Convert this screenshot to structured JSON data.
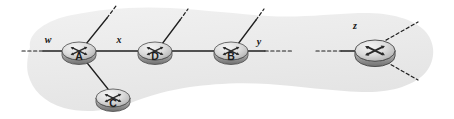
{
  "diagram": {
    "type": "network-diagram",
    "canvas": {
      "width": 454,
      "height": 119
    },
    "colors": {
      "background": "#ffffff",
      "cloud_fill": "#ececec",
      "cloud_fill_light": "#f3f3f3",
      "link_stroke": "#1f1f1f",
      "router_body_light": "#e8e8e8",
      "router_body_mid": "#b9b9b9",
      "router_body_dark": "#8d8d8d",
      "router_outline": "#4a4a4a",
      "label_text": "#141414"
    },
    "cloud": {
      "name": "network-cloud",
      "description": "irregular light gray amoeba-shaped region enclosing the routers"
    },
    "routers": [
      {
        "id": "A",
        "label": "A",
        "cx": 79,
        "cy": 51,
        "rx": 17,
        "ry": 9,
        "has_label": true
      },
      {
        "id": "D",
        "label": "D",
        "cx": 155,
        "cy": 51,
        "rx": 17,
        "ry": 9,
        "has_label": true
      },
      {
        "id": "B",
        "label": "B",
        "cx": 231,
        "cy": 51,
        "rx": 17,
        "ry": 9,
        "has_label": true
      },
      {
        "id": "C",
        "label": "C",
        "cx": 113,
        "cy": 98,
        "rx": 17,
        "ry": 9,
        "has_label": true
      },
      {
        "id": "Z",
        "label": "",
        "cx": 375,
        "cy": 51,
        "rx": 20,
        "ry": 11,
        "has_label": false
      }
    ],
    "edge_labels": [
      {
        "id": "w",
        "text": "w",
        "x": 48,
        "y": 43
      },
      {
        "id": "x",
        "text": "x",
        "x": 119,
        "y": 43
      },
      {
        "id": "y",
        "text": "y",
        "x": 259,
        "y": 45
      },
      {
        "id": "z",
        "text": "z",
        "x": 355,
        "y": 29
      }
    ],
    "links": [
      {
        "id": "link-w-dashed",
        "from": "external-left",
        "to": "A",
        "style": "dashed"
      },
      {
        "id": "link-w-solid",
        "from": "w",
        "to": "A",
        "style": "solid"
      },
      {
        "id": "link-A-D",
        "from": "A",
        "to": "D",
        "style": "solid"
      },
      {
        "id": "link-D-B",
        "from": "D",
        "to": "B",
        "style": "solid"
      },
      {
        "id": "link-A-C",
        "from": "A",
        "to": "C",
        "style": "solid"
      },
      {
        "id": "link-A-up",
        "from": "A",
        "to": "external-up",
        "style": "solid-to-dashed"
      },
      {
        "id": "link-D-up",
        "from": "D",
        "to": "external-up",
        "style": "solid-to-dashed"
      },
      {
        "id": "link-B-up",
        "from": "B",
        "to": "external-up",
        "style": "solid-to-dashed"
      },
      {
        "id": "link-B-y",
        "from": "B",
        "to": "y",
        "style": "solid"
      },
      {
        "id": "link-y-dashed",
        "from": "y",
        "to": "gap",
        "style": "dashed"
      },
      {
        "id": "link-gap-Z",
        "from": "gap",
        "to": "Z",
        "style": "dashed-to-solid"
      },
      {
        "id": "link-Z-upright",
        "from": "Z",
        "to": "external-up-right",
        "style": "dashed"
      },
      {
        "id": "link-Z-downright",
        "from": "Z",
        "to": "external-down-right",
        "style": "dashed"
      }
    ]
  }
}
